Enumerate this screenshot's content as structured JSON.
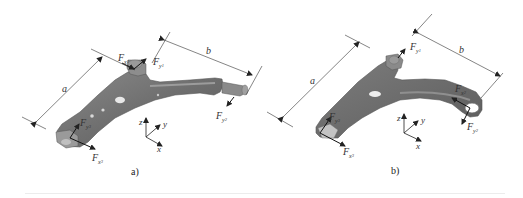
{
  "figure": {
    "panels": [
      {
        "id": "a",
        "caption": "a)",
        "dimensions": {
          "a": "a",
          "b": "b"
        },
        "forces": [
          {
            "name": "F",
            "sub": "x",
            "subsub": "1"
          },
          {
            "name": "F",
            "sub": "y",
            "subsub": "1"
          },
          {
            "name": "F",
            "sub": "y",
            "subsub": "2"
          },
          {
            "name": "F",
            "sub": "y",
            "subsub": "3"
          },
          {
            "name": "F",
            "sub": "x",
            "subsub": "3"
          }
        ],
        "axes": {
          "z": "z",
          "y": "y",
          "x": "x"
        }
      },
      {
        "id": "b",
        "caption": "b)",
        "dimensions": {
          "a": "a",
          "b": "b"
        },
        "forces": [
          {
            "name": "F",
            "sub": "y",
            "subsub": "1"
          },
          {
            "name": "F",
            "sub": "x",
            "subsub": "2"
          },
          {
            "name": "F",
            "sub": "y",
            "subsub": "2"
          },
          {
            "name": "F",
            "sub": "y",
            "subsub": "3"
          },
          {
            "name": "F",
            "sub": "x",
            "subsub": "3"
          }
        ],
        "axes": {
          "z": "z",
          "y": "y",
          "x": "x"
        }
      }
    ],
    "colors": {
      "part_body": "#7a7a7a",
      "part_dark": "#5e5e5e",
      "part_light": "#a8a8a8",
      "line": "#333333",
      "background": "#ffffff"
    }
  }
}
